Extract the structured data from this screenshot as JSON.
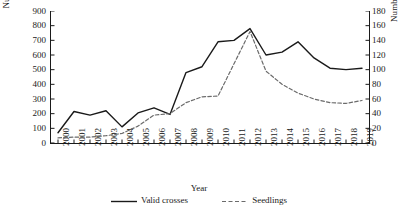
{
  "chart_data": {
    "type": "line",
    "title": "",
    "xlabel": "Year",
    "categories": [
      "2000",
      "2001",
      "2002",
      "2003",
      "2004",
      "2005",
      "2006",
      "2007",
      "2008",
      "2009",
      "2010",
      "2011",
      "2012",
      "2013",
      "2014",
      "2015",
      "2016",
      "2017",
      "2018",
      "2019"
    ],
    "grid": false,
    "legend_position": "bottom",
    "axes": {
      "left": {
        "label": "Number of crosses",
        "ticks": [
          0,
          100,
          200,
          300,
          400,
          500,
          600,
          700,
          800,
          900
        ],
        "min": 0,
        "max": 900
      },
      "right": {
        "label": "Number of seedlings ( 1,000 )",
        "ticks": [
          0,
          20,
          40,
          60,
          80,
          100,
          120,
          140,
          160,
          180
        ],
        "min": 0,
        "max": 180
      }
    },
    "series": [
      {
        "name": "Valid crosses",
        "axis": "left",
        "style": "solid",
        "color": "#1a1a1a",
        "values": [
          70,
          215,
          190,
          220,
          110,
          205,
          240,
          195,
          480,
          520,
          690,
          700,
          780,
          600,
          620,
          690,
          580,
          510,
          500,
          510
        ]
      },
      {
        "name": "Seedlings",
        "axis": "right",
        "style": "dashed",
        "color": "#6b6b6b",
        "values": [
          7,
          8,
          8,
          10,
          13,
          23,
          38,
          40,
          55,
          63,
          64,
          108,
          152,
          98,
          80,
          68,
          60,
          55,
          54,
          58
        ]
      }
    ]
  },
  "legend": {
    "items": [
      {
        "label": "Valid crosses",
        "style": "solid"
      },
      {
        "label": "Seedlings",
        "style": "dashed"
      }
    ]
  }
}
